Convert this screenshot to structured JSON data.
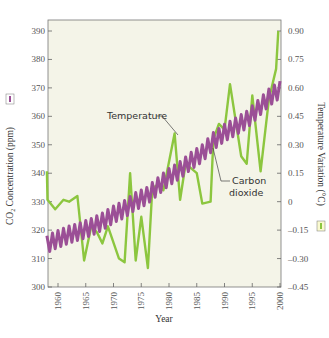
{
  "chart_data": {
    "type": "line",
    "title": "",
    "xlabel": "Year",
    "ylabel": "CO2 Concentration (ppm)",
    "y2label": "Temperature Variation (°C)",
    "xlim": [
      1958,
      2000
    ],
    "ylim": [
      300,
      393
    ],
    "y2lim": [
      -0.45,
      0.95
    ],
    "x_ticks": [
      1960,
      1965,
      1970,
      1975,
      1980,
      1985,
      1990,
      1995,
      2000
    ],
    "y_ticks": [
      300,
      310,
      320,
      330,
      340,
      350,
      360,
      370,
      380,
      390
    ],
    "y2_ticks": [
      -0.45,
      -0.3,
      -0.15,
      0,
      0.15,
      0.3,
      0.45,
      0.6,
      0.75,
      0.9
    ],
    "y2_tick_labels": [
      "–0.45",
      "–0.30",
      "–0.15",
      "0",
      "0.15",
      "0.30",
      "0.45",
      "0.60",
      "0.75",
      "0.90"
    ],
    "grid": false,
    "legend": "inline annotations",
    "annotations": [
      "Temperature",
      "Carbon dioxide"
    ],
    "series": [
      {
        "name": "Carbon dioxide",
        "axis": "left",
        "color": "#9b4f96",
        "seasonal_amplitude_ppm": 3,
        "x": [
          1958,
          1960,
          1962,
          1964,
          1966,
          1968,
          1970,
          1972,
          1974,
          1976,
          1978,
          1980,
          1982,
          1984,
          1986,
          1988,
          1990,
          1992,
          1994,
          1996,
          1998,
          2000
        ],
        "values": [
          315,
          316.9,
          318.4,
          319.6,
          321.1,
          323.0,
          325.5,
          327.4,
          330.2,
          332.0,
          335.4,
          338.7,
          341.1,
          344.4,
          347.0,
          351.3,
          354.2,
          356.4,
          358.8,
          362.6,
          366.6,
          369.4
        ]
      },
      {
        "name": "Temperature",
        "axis": "right",
        "color": "#8cc63f",
        "x": [
          1958,
          1958.1,
          1959.5,
          1961,
          1962,
          1963.5,
          1964.7,
          1966,
          1967,
          1968,
          1969,
          1971,
          1972,
          1973,
          1974,
          1975,
          1976.2,
          1977,
          1978,
          1979,
          1981,
          1982,
          1983,
          1985,
          1986,
          1987.5,
          1988,
          1989,
          1990,
          1991,
          1993,
          1994,
          1995,
          1996.5,
          1998,
          1999.3,
          1999.7
        ],
        "values": [
          0.16,
          0.01,
          -0.04,
          0.01,
          0.0,
          0.03,
          -0.31,
          -0.13,
          -0.16,
          -0.22,
          -0.13,
          -0.3,
          -0.32,
          0.15,
          -0.31,
          -0.08,
          -0.35,
          0.07,
          0.09,
          0.06,
          0.36,
          0.01,
          0.2,
          0.15,
          -0.01,
          0.0,
          0.33,
          0.41,
          0.38,
          0.62,
          0.24,
          0.2,
          0.56,
          0.16,
          0.54,
          0.7,
          0.9
        ]
      }
    ]
  },
  "labels": {
    "temperature": "Temperature",
    "carbon_line1": "Carbon",
    "carbon_line2": "dioxide",
    "xlabel": "Year",
    "ylabel_left": "CO₂ Concentration (ppm)",
    "ylabel_right": "Temperature Variation (°C)"
  },
  "colors": {
    "plot_bg": "#f4f4e8",
    "co2": "#9b4f96",
    "temperature": "#8cc63f",
    "axis": "#666666"
  }
}
